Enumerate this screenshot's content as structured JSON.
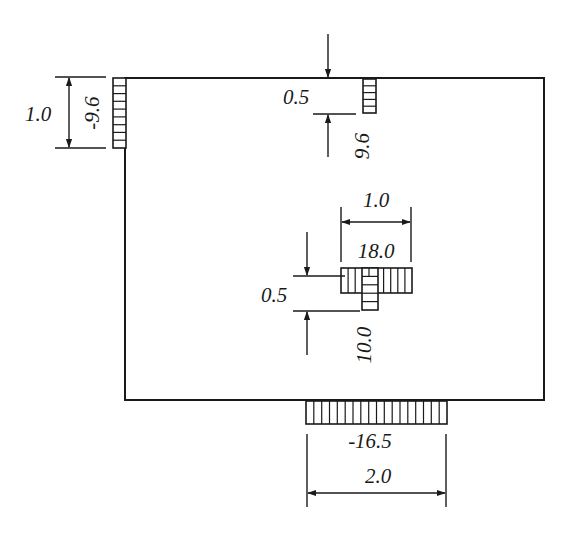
{
  "diagram": {
    "type": "plate-with-loaded-strips",
    "plate": {
      "x": 125,
      "y": 78,
      "width": 419,
      "height": 322
    },
    "colors": {
      "ink": "#1a1a1a",
      "background": "#ffffff"
    },
    "strips": [
      {
        "id": "left-edge-strip",
        "x": 113,
        "y": 78,
        "width": 13,
        "height": 70,
        "hatch": "horizontal",
        "cells": 9
      },
      {
        "id": "top-strip",
        "x": 363,
        "y": 79,
        "width": 13,
        "height": 34,
        "hatch": "horizontal",
        "cells": 5
      },
      {
        "id": "center-horizontal-strip",
        "x": 341,
        "y": 268,
        "width": 71,
        "height": 25,
        "hatch": "vertical",
        "cells": 10
      },
      {
        "id": "center-vertical-strip",
        "x": 362,
        "y": 268,
        "width": 16,
        "height": 42,
        "hatch": "horizontal",
        "cells": 5
      },
      {
        "id": "bottom-strip",
        "x": 306,
        "y": 401,
        "width": 141,
        "height": 23,
        "hatch": "vertical",
        "cells": 18
      }
    ],
    "labels": {
      "left_width": "1.0",
      "left_load": "-9.6",
      "top_width": "0.5",
      "top_load": "9.6",
      "center_h_width": "1.0",
      "center_h_load": "18.0",
      "center_v_width": "0.5",
      "center_v_load": "10.0",
      "bottom_load": "-16.5",
      "bottom_width": "2.0"
    }
  }
}
